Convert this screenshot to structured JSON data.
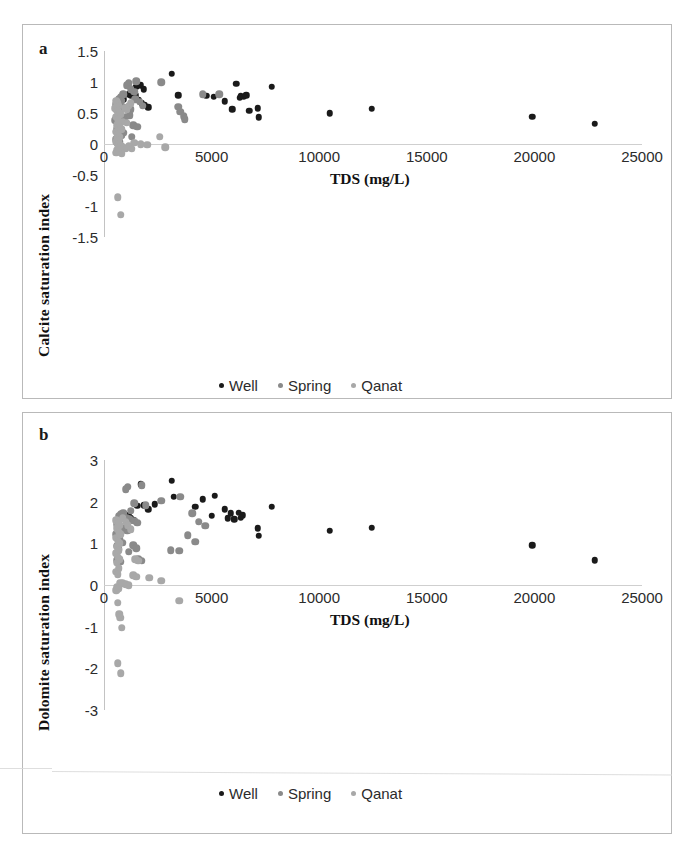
{
  "figure": {
    "background": "#ffffff",
    "series_colors": {
      "Well": "#1a1a1a",
      "Spring": "#8a8a8a",
      "Qanat": "#a8a8a8"
    }
  },
  "panels": [
    {
      "letter": "a",
      "ylabel": "Calcite saturation index",
      "xlabel": "TDS (mg/L)",
      "yticks": [
        "1.5",
        "1",
        "0.5",
        "0",
        "-0.5",
        "-1",
        "-1.5"
      ],
      "xticks": [
        "0",
        "5000",
        "10000",
        "15000",
        "20000",
        "25000"
      ],
      "legend": [
        {
          "label": "Well",
          "color": "#1a1a1a"
        },
        {
          "label": "Spring",
          "color": "#8a8a8a"
        },
        {
          "label": "Qanat",
          "color": "#a8a8a8"
        }
      ]
    },
    {
      "letter": "b",
      "ylabel": "Dolomite saturation index",
      "xlabel": "TDS (mg/L)",
      "yticks": [
        "3",
        "2",
        "1",
        "0",
        "-1",
        "-2",
        "-3"
      ],
      "xticks": [
        "0",
        "5000",
        "10000",
        "15000",
        "20000",
        "25000"
      ],
      "legend": [
        {
          "label": "Well",
          "color": "#1a1a1a"
        },
        {
          "label": "Spring",
          "color": "#8a8a8a"
        },
        {
          "label": "Qanat",
          "color": "#a8a8a8"
        }
      ]
    }
  ],
  "chart_data": [
    {
      "type": "scatter",
      "panel": "a",
      "title": "",
      "xlabel": "TDS (mg/L)",
      "ylabel": "Calcite saturation index",
      "xlim": [
        0,
        25000
      ],
      "ylim": [
        -1.5,
        1.5
      ],
      "xticks": [
        0,
        5000,
        10000,
        15000,
        20000,
        25000
      ],
      "yticks": [
        1.5,
        1,
        0.5,
        0,
        -0.5,
        -1,
        -1.5
      ],
      "grid": false,
      "zero_reference_line": 0,
      "legend_position": "bottom-center",
      "series": [
        {
          "name": "Well",
          "color": "#1a1a1a",
          "points": [
            [
              3150,
              1.13
            ],
            [
              1700,
              0.95
            ],
            [
              1500,
              0.92
            ],
            [
              1850,
              0.88
            ],
            [
              1150,
              0.8
            ],
            [
              1450,
              0.79
            ],
            [
              1250,
              0.78
            ],
            [
              900,
              0.72
            ],
            [
              1600,
              0.71
            ],
            [
              1750,
              0.66
            ],
            [
              3450,
              0.79
            ],
            [
              4750,
              0.78
            ],
            [
              5100,
              0.76
            ],
            [
              5600,
              0.69
            ],
            [
              6150,
              0.97
            ],
            [
              6350,
              0.78
            ],
            [
              6500,
              0.76
            ],
            [
              6600,
              0.79
            ],
            [
              6300,
              0.75
            ],
            [
              5950,
              0.56
            ],
            [
              6750,
              0.54
            ],
            [
              7800,
              0.92
            ],
            [
              7150,
              0.58
            ],
            [
              7200,
              0.43
            ],
            [
              10500,
              0.5
            ],
            [
              12450,
              0.57
            ],
            [
              19900,
              0.44
            ],
            [
              22800,
              0.33
            ],
            [
              1900,
              0.63
            ],
            [
              2050,
              0.59
            ],
            [
              1350,
              0.86
            ]
          ]
        },
        {
          "name": "Spring",
          "color": "#8a8a8a",
          "points": [
            [
              1500,
              1.01
            ],
            [
              1150,
              0.98
            ],
            [
              1050,
              0.95
            ],
            [
              1250,
              0.88
            ],
            [
              2650,
              1.0
            ],
            [
              1400,
              0.84
            ],
            [
              900,
              0.8
            ],
            [
              780,
              0.76
            ],
            [
              700,
              0.73
            ],
            [
              820,
              0.7
            ],
            [
              650,
              0.68
            ],
            [
              600,
              0.66
            ],
            [
              560,
              0.64
            ],
            [
              700,
              0.62
            ],
            [
              880,
              0.6
            ],
            [
              1000,
              0.58
            ],
            [
              1250,
              0.56
            ],
            [
              1450,
              0.72
            ],
            [
              1650,
              0.68
            ],
            [
              1800,
              0.62
            ],
            [
              3450,
              0.6
            ],
            [
              3550,
              0.52
            ],
            [
              4600,
              0.8
            ],
            [
              5350,
              0.8
            ],
            [
              3700,
              0.45
            ],
            [
              3750,
              0.4
            ],
            [
              1200,
              0.46
            ],
            [
              1000,
              0.44
            ],
            [
              850,
              0.42
            ],
            [
              620,
              0.4
            ],
            [
              520,
              0.38
            ],
            [
              1350,
              0.3
            ],
            [
              1550,
              0.28
            ],
            [
              700,
              0.26
            ],
            [
              600,
              0.24
            ],
            [
              900,
              0.18
            ],
            [
              800,
              0.14
            ],
            [
              1300,
              0.12
            ],
            [
              560,
              0.08
            ],
            [
              680,
              0.06
            ],
            [
              740,
              0.04
            ],
            [
              620,
              0.02
            ]
          ]
        },
        {
          "name": "Qanat",
          "color": "#a8a8a8",
          "points": [
            [
              560,
              0.7
            ],
            [
              620,
              0.66
            ],
            [
              680,
              0.62
            ],
            [
              520,
              0.58
            ],
            [
              600,
              0.54
            ],
            [
              700,
              0.5
            ],
            [
              760,
              0.48
            ],
            [
              560,
              0.44
            ],
            [
              640,
              0.4
            ],
            [
              880,
              0.36
            ],
            [
              1050,
              0.34
            ],
            [
              620,
              0.3
            ],
            [
              700,
              0.28
            ],
            [
              800,
              0.24
            ],
            [
              560,
              0.2
            ],
            [
              640,
              0.16
            ],
            [
              720,
              0.12
            ],
            [
              600,
              0.1
            ],
            [
              680,
              0.06
            ],
            [
              560,
              0.04
            ],
            [
              640,
              0.0
            ],
            [
              720,
              -0.02
            ],
            [
              800,
              -0.04
            ],
            [
              900,
              -0.06
            ],
            [
              1000,
              -0.08
            ],
            [
              620,
              -0.1
            ],
            [
              700,
              -0.12
            ],
            [
              560,
              -0.14
            ],
            [
              2600,
              0.12
            ],
            [
              1400,
              0.02
            ],
            [
              1700,
              0.0
            ],
            [
              2000,
              -0.01
            ],
            [
              2850,
              -0.05
            ],
            [
              1150,
              -0.04
            ],
            [
              1300,
              -0.08
            ],
            [
              820,
              -0.16
            ],
            [
              640,
              -0.86
            ],
            [
              780,
              -1.14
            ],
            [
              1050,
              0.55
            ],
            [
              1150,
              0.62
            ],
            [
              1250,
              0.66
            ],
            [
              980,
              0.58
            ]
          ]
        }
      ]
    },
    {
      "type": "scatter",
      "panel": "b",
      "title": "",
      "xlabel": "TDS (mg/L)",
      "ylabel": "Dolomite saturation index",
      "xlim": [
        0,
        25000
      ],
      "ylim": [
        -3,
        3
      ],
      "xticks": [
        0,
        5000,
        10000,
        15000,
        20000,
        25000
      ],
      "yticks": [
        3,
        2,
        1,
        0,
        -1,
        -2,
        -3
      ],
      "grid": false,
      "zero_reference_line": 0,
      "legend_position": "bottom-center",
      "series": [
        {
          "name": "Well",
          "color": "#1a1a1a",
          "points": [
            [
              3150,
              2.5
            ],
            [
              1700,
              2.42
            ],
            [
              1750,
              2.38
            ],
            [
              3250,
              2.12
            ],
            [
              1550,
              1.9
            ],
            [
              1850,
              1.92
            ],
            [
              1150,
              1.68
            ],
            [
              1250,
              1.6
            ],
            [
              1350,
              1.55
            ],
            [
              4600,
              2.06
            ],
            [
              4250,
              1.88
            ],
            [
              5150,
              2.14
            ],
            [
              5600,
              1.82
            ],
            [
              5900,
              1.72
            ],
            [
              5750,
              1.6
            ],
            [
              6050,
              1.58
            ],
            [
              6250,
              1.74
            ],
            [
              6450,
              1.68
            ],
            [
              6350,
              1.62
            ],
            [
              7800,
              1.88
            ],
            [
              7150,
              1.36
            ],
            [
              7200,
              1.18
            ],
            [
              10500,
              1.3
            ],
            [
              12450,
              1.38
            ],
            [
              19900,
              0.95
            ],
            [
              22800,
              0.6
            ],
            [
              2050,
              1.82
            ],
            [
              2350,
              1.94
            ],
            [
              5000,
              1.66
            ]
          ]
        },
        {
          "name": "Spring",
          "color": "#8a8a8a",
          "points": [
            [
              1100,
              2.36
            ],
            [
              1000,
              2.3
            ],
            [
              1750,
              2.4
            ],
            [
              2650,
              2.02
            ],
            [
              3550,
              2.12
            ],
            [
              1400,
              1.96
            ],
            [
              1950,
              1.92
            ],
            [
              1250,
              1.78
            ],
            [
              900,
              1.74
            ],
            [
              800,
              1.7
            ],
            [
              700,
              1.66
            ],
            [
              1050,
              1.62
            ],
            [
              1200,
              1.58
            ],
            [
              1400,
              1.54
            ],
            [
              1550,
              1.5
            ],
            [
              620,
              1.46
            ],
            [
              720,
              1.42
            ],
            [
              840,
              1.38
            ],
            [
              960,
              1.34
            ],
            [
              1080,
              1.3
            ],
            [
              4100,
              1.72
            ],
            [
              4400,
              1.52
            ],
            [
              4700,
              1.42
            ],
            [
              3900,
              1.2
            ],
            [
              4250,
              1.04
            ],
            [
              3100,
              0.84
            ],
            [
              3500,
              0.82
            ],
            [
              1350,
              0.96
            ],
            [
              1500,
              0.88
            ],
            [
              1150,
              0.8
            ],
            [
              560,
              1.22
            ],
            [
              640,
              1.16
            ],
            [
              720,
              1.1
            ],
            [
              840,
              1.02
            ],
            [
              600,
              0.94
            ],
            [
              680,
              0.86
            ],
            [
              1600,
              0.62
            ],
            [
              1750,
              0.58
            ],
            [
              620,
              0.6
            ],
            [
              760,
              0.56
            ]
          ]
        },
        {
          "name": "Qanat",
          "color": "#a8a8a8",
          "points": [
            [
              560,
              1.56
            ],
            [
              640,
              1.48
            ],
            [
              720,
              1.44
            ],
            [
              600,
              1.36
            ],
            [
              680,
              1.28
            ],
            [
              760,
              1.22
            ],
            [
              560,
              1.14
            ],
            [
              640,
              1.06
            ],
            [
              720,
              1.0
            ],
            [
              600,
              0.92
            ],
            [
              680,
              0.84
            ],
            [
              560,
              0.76
            ],
            [
              640,
              0.68
            ],
            [
              720,
              0.62
            ],
            [
              600,
              0.54
            ],
            [
              1450,
              0.62
            ],
            [
              1600,
              0.58
            ],
            [
              680,
              0.4
            ],
            [
              560,
              0.32
            ],
            [
              640,
              0.26
            ],
            [
              1350,
              0.24
            ],
            [
              1500,
              0.2
            ],
            [
              2100,
              0.18
            ],
            [
              2650,
              0.1
            ],
            [
              760,
              0.06
            ],
            [
              880,
              0.04
            ],
            [
              1000,
              0.02
            ],
            [
              1150,
              0.0
            ],
            [
              600,
              -0.04
            ],
            [
              680,
              -0.08
            ],
            [
              560,
              -0.12
            ],
            [
              640,
              -0.42
            ],
            [
              3500,
              -0.38
            ],
            [
              760,
              -0.78
            ],
            [
              700,
              -0.7
            ],
            [
              820,
              -1.02
            ],
            [
              640,
              -1.88
            ],
            [
              780,
              -2.12
            ],
            [
              880,
              1.6
            ],
            [
              1000,
              1.52
            ],
            [
              1100,
              1.44
            ],
            [
              1250,
              1.34
            ]
          ]
        }
      ]
    }
  ]
}
